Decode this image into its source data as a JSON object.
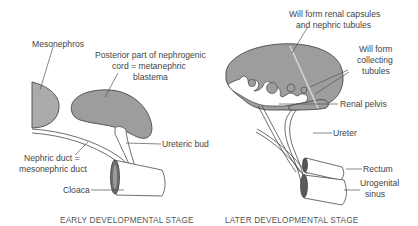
{
  "early_stage": {
    "caption": "EARLY DEVELOPMENTAL STAGE",
    "labels": {
      "mesonephros": "Mesonephros",
      "blastema_line1": "Posterior part of nephrogenic",
      "blastema_line2": "cord = metanephric",
      "blastema_line3": "blastema",
      "ureteric_bud": "Ureteric bud",
      "nephric_duct_line1": "Nephric duct =",
      "nephric_duct_line2": "mesonephric duct",
      "cloaca": "Cloaca"
    }
  },
  "later_stage": {
    "caption": "LATER DEVELOPMENTAL STAGE",
    "labels": {
      "renal_capsules_line1": "Will form renal capsules",
      "renal_capsules_line2": "and nephric tubules",
      "collecting_line1": "Will form",
      "collecting_line2": "collecting",
      "collecting_line3": "tubules",
      "renal_pelvis": "Renal pelvis",
      "ureter": "Ureter",
      "rectum": "Rectum",
      "urogenital_line1": "Urogenital",
      "urogenital_line2": "sinus"
    }
  },
  "colors": {
    "tissue_fill": "#9d9d9d",
    "outline": "#4a4a4a",
    "label_text": "#444444",
    "background": "#ffffff"
  }
}
